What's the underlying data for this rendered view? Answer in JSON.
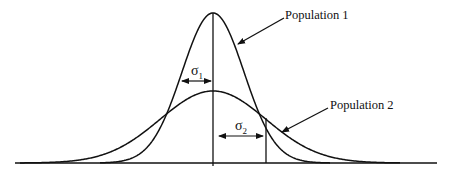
{
  "diagram": {
    "type": "normal-distribution-comparison",
    "labels": {
      "population1": "Population 1",
      "population2": "Population 2",
      "sigma1": "σ",
      "sigma1_sub": "1",
      "sigma2": "σ",
      "sigma2_sub": "2"
    },
    "curves": [
      {
        "name": "Population 1",
        "mean": 0,
        "sd": "σ1 (narrow)",
        "relative_peak": 1.0
      },
      {
        "name": "Population 2",
        "mean": 0,
        "sd": "σ2 (wide)",
        "relative_peak": 0.48
      }
    ],
    "colors": {
      "line": "#111111",
      "background": "#ffffff"
    }
  }
}
